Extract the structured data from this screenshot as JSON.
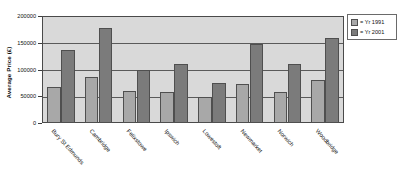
{
  "chart_data": {
    "type": "bar",
    "title": "",
    "subtitle": "",
    "xlabel": "",
    "ylabel": "Average Price (£)",
    "ylim": [
      0,
      200000
    ],
    "yticks": [
      "0",
      "50000",
      "100000",
      "150000",
      "200000"
    ],
    "ytick_values": [
      0,
      50000,
      100000,
      150000,
      200000
    ],
    "grid": "horizontal",
    "legend_position": "right-top",
    "categories": [
      "Bury St Edmunds",
      "Cambridge",
      "Felixstowe",
      "Ipswich",
      "Lowestoft",
      "Newmarket",
      "Norwich",
      "Woodbridge"
    ],
    "series": [
      {
        "name": "= Yr 1991",
        "color": "#a8a8a8",
        "values": [
          67000,
          86000,
          59000,
          58000,
          48000,
          72000,
          58000,
          81000
        ]
      },
      {
        "name": "= Yr 2001",
        "color": "#7b7b7b",
        "values": [
          137000,
          178000,
          99000,
          110000,
          74000,
          148000,
          111000,
          158000
        ]
      }
    ],
    "plot_background": "#d9d9d9",
    "frame_color": "#4a4a4a"
  },
  "legend": {
    "items": [
      {
        "label": "= Yr 1991"
      },
      {
        "label": "= Yr 2001"
      }
    ]
  }
}
